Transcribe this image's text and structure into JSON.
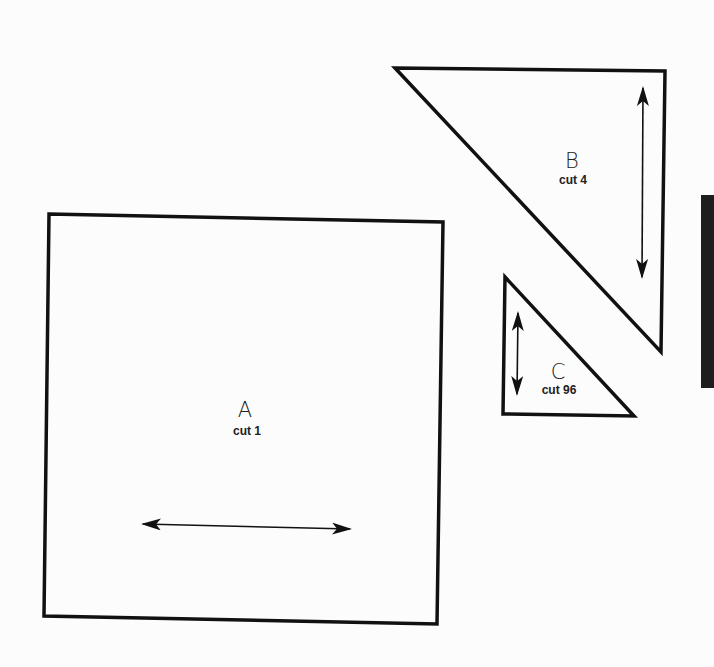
{
  "diagram": {
    "type": "quilt-template-pieces",
    "background_color": "#fcfcfc",
    "line_color": "#111111",
    "pieces": [
      {
        "id": "A",
        "letter": "A",
        "cut_label": "cut 1",
        "shape": "square",
        "points": [
          [
            49,
            214
          ],
          [
            443,
            222
          ],
          [
            437,
            624
          ],
          [
            44,
            616
          ]
        ],
        "grain_arrow": {
          "orientation": "horizontal",
          "from": [
            143,
            524
          ],
          "to": [
            350,
            529
          ]
        },
        "label_pos": {
          "letter": [
            245,
            400
          ],
          "cut": [
            247,
            424
          ]
        }
      },
      {
        "id": "B",
        "letter": "B",
        "cut_label": "cut 4",
        "shape": "right-triangle",
        "points": [
          [
            395,
            68
          ],
          [
            665,
            71
          ],
          [
            661,
            352
          ]
        ],
        "grain_arrow": {
          "orientation": "vertical",
          "from": [
            643,
            88
          ],
          "to": [
            642,
            277
          ]
        },
        "label_pos": {
          "letter": [
            572,
            150
          ],
          "cut": [
            573,
            172
          ]
        }
      },
      {
        "id": "C",
        "letter": "C",
        "cut_label": "cut 96",
        "shape": "right-triangle",
        "points": [
          [
            505,
            277
          ],
          [
            634,
            416
          ],
          [
            503,
            414
          ]
        ],
        "grain_arrow": {
          "orientation": "vertical",
          "from": [
            518,
            313
          ],
          "to": [
            517,
            394
          ]
        },
        "label_pos": {
          "letter": [
            558,
            363
          ],
          "cut": [
            559,
            385
          ]
        }
      }
    ],
    "side_tab": {
      "color": "#1e1e1e"
    }
  }
}
